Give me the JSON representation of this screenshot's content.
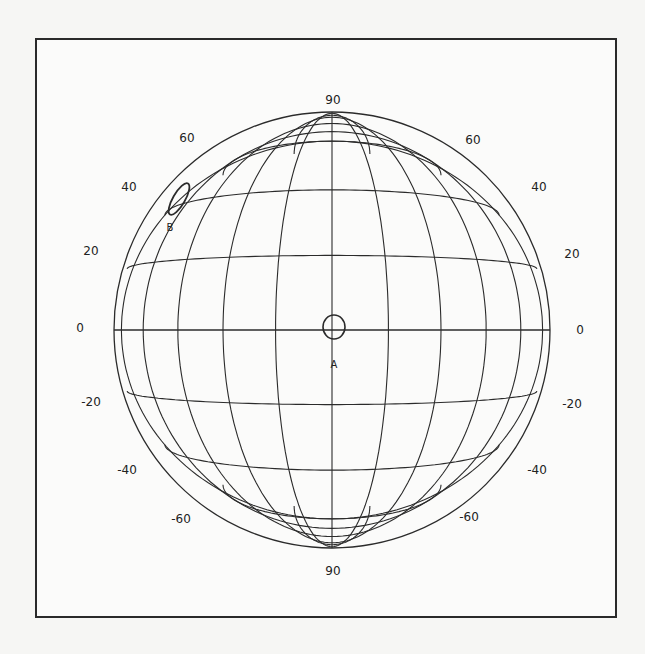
{
  "figure": {
    "type": "globe-projection-grid",
    "frame_color": "#2a2a2a",
    "line_color": "#2b2b2b",
    "latitude_labels_left": [
      "60",
      "40",
      "20",
      "0",
      "-20",
      "-40",
      "-60"
    ],
    "latitude_labels_right": [
      "60",
      "40",
      "20",
      "0",
      "-20",
      "-40",
      "-60"
    ],
    "pole_label_top": "90",
    "pole_label_bottom": "90",
    "markers": [
      {
        "id": "A",
        "label": "A",
        "shape": "circle",
        "description": "small circle on the equator at the central meridian"
      },
      {
        "id": "B",
        "label": "B",
        "shape": "ellipse",
        "description": "tilted ellipse near latitude 35-40, left limb"
      }
    ]
  },
  "background_text_bleedthrough": [
    "able 11.1 ... ",
    "Scale        Projection",
    "1:50,000  ...   ...  of Venus",
    "1:20,000 ...    ...",
    "1:5,0 16,000 ...",
    "1:10,000,000 ...",
    "1:5,000,000 ...",
    "1:2,000,000 ...",
    "The selection of the ... originally",
    "observed ... Mars ..."
  ]
}
